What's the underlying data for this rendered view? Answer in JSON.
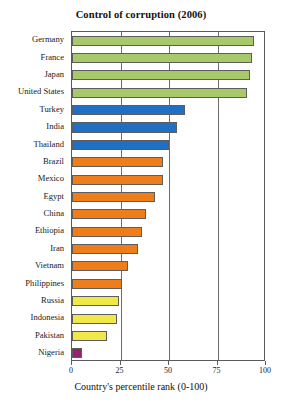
{
  "chart_data": {
    "type": "bar",
    "orientation": "horizontal",
    "title": "Control of corruption (2006)",
    "xlabel": "Country's percentile rank (0-100)",
    "ylabel": "",
    "xlim": [
      0,
      100
    ],
    "xticks": [
      0,
      25,
      50,
      75,
      100
    ],
    "xtick_labels": [
      "0",
      "25",
      "50",
      "75",
      "100"
    ],
    "grid": true,
    "grid_axis": "x",
    "legend": "none",
    "categories": [
      "Germany",
      "France",
      "Japan",
      "United States",
      "Turkey",
      "India",
      "Thailand",
      "Brazil",
      "Mexico",
      "Egypt",
      "China",
      "Ethiopia",
      "Iran",
      "Vietnam",
      "Philippines",
      "Russia",
      "Indonesia",
      "Pakistan",
      "Nigeria"
    ],
    "values": [
      94,
      93,
      92,
      90,
      58,
      54,
      50,
      47,
      47,
      43,
      38,
      36,
      34,
      29,
      26,
      24,
      23,
      18,
      5
    ],
    "bar_colors": [
      "#a8c96a",
      "#a8c96a",
      "#a8c96a",
      "#a8c96a",
      "#1f6fc4",
      "#1f6fc4",
      "#1f6fc4",
      "#ef7d1a",
      "#ef7d1a",
      "#ef7d1a",
      "#ef7d1a",
      "#ef7d1a",
      "#ef7d1a",
      "#ef7d1a",
      "#ef7d1a",
      "#f0e849",
      "#f0e849",
      "#f0e849",
      "#96216e"
    ],
    "color_groups": {
      "green": "#a8c96a",
      "blue": "#1f6fc4",
      "orange": "#ef7d1a",
      "yellow": "#f0e849",
      "magenta": "#96216e"
    }
  }
}
